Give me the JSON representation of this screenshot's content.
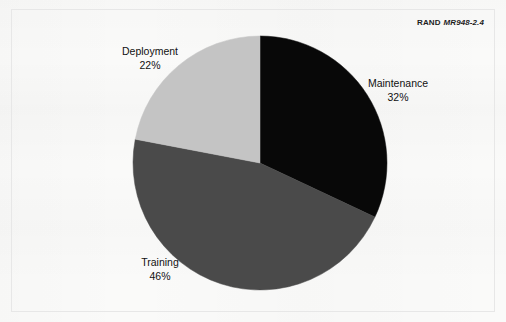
{
  "figure": {
    "credit_org": "RAND",
    "credit_number": "MR948-2.4",
    "background_color": "#fafaf9",
    "frame_color": "#e7e7e7"
  },
  "chart_data": {
    "type": "pie",
    "title": "",
    "subtitle": "",
    "xlabel": "",
    "ylabel": "",
    "legend_position": "none",
    "grid": false,
    "start_angle_deg": 0,
    "direction": "clockwise",
    "center": {
      "x": 260,
      "y": 163
    },
    "radius": 127,
    "categories": [
      "Maintenance",
      "Training",
      "Deployment"
    ],
    "values": [
      32,
      46,
      22
    ],
    "value_unit": "%",
    "colors": [
      "#080808",
      "#4a4a4a",
      "#c4c4c4"
    ],
    "slices": [
      {
        "name": "Maintenance",
        "value": 32,
        "label": "Maintenance",
        "pct_label": "32%",
        "color": "#080808",
        "start_deg": 0,
        "end_deg": 115.2
      },
      {
        "name": "Training",
        "value": 46,
        "label": "Training",
        "pct_label": "46%",
        "color": "#4a4a4a",
        "start_deg": 115.2,
        "end_deg": 280.8
      },
      {
        "name": "Deployment",
        "value": 22,
        "label": "Deployment",
        "pct_label": "22%",
        "color": "#c4c4c4",
        "start_deg": 280.8,
        "end_deg": 360
      }
    ]
  }
}
